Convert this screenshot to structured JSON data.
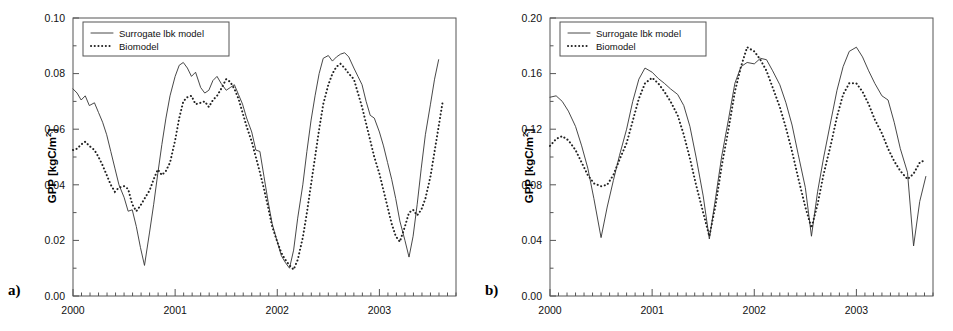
{
  "figure": {
    "panels": [
      {
        "tag": "a)",
        "ylabel_main": "GPP [kgC/m",
        "ylabel_sup": "2",
        "ylabel_close": "]"
      },
      {
        "tag": "b)",
        "ylabel_main": "GPP [kgC/m",
        "ylabel_sup": "2",
        "ylabel_close": "]"
      }
    ],
    "legend": {
      "series1_label": "Surrogate lbk model",
      "series2_label": "Biomodel"
    }
  },
  "chart_data": [
    {
      "panel": "a)",
      "type": "line",
      "title": "",
      "xlabel": "",
      "ylabel": "GPP [kgC/m2]",
      "ylim": [
        0.0,
        0.1
      ],
      "yticks": [
        "0.00",
        "0.02",
        "0.04",
        "0.06",
        "0.08",
        "0.10"
      ],
      "ytick_values": [
        0.0,
        0.02,
        0.04,
        0.06,
        0.08,
        0.1
      ],
      "xlim": [
        2000.0,
        2003.75
      ],
      "xticks": [
        "2000",
        "2001",
        "2002",
        "2003"
      ],
      "xtick_values": [
        2000,
        2001,
        2002,
        2003
      ],
      "minor_ticks_per_interval": 12,
      "grid": false,
      "legend_position": "top-left",
      "series": [
        {
          "name": "Surrogate lbk model",
          "style": "solid",
          "x": [
            2000.0,
            2000.04,
            2000.08,
            2000.12,
            2000.16,
            2000.21,
            2000.25,
            2000.29,
            2000.33,
            2000.37,
            2000.41,
            2000.45,
            2000.5,
            2000.54,
            2000.58,
            2000.62,
            2000.66,
            2000.7,
            2000.75,
            2000.79,
            2000.83,
            2000.87,
            2000.91,
            2000.95,
            2001.0,
            2001.04,
            2001.08,
            2001.12,
            2001.16,
            2001.2,
            2001.25,
            2001.29,
            2001.33,
            2001.37,
            2001.41,
            2001.45,
            2001.5,
            2001.54,
            2001.58,
            2001.62,
            2001.66,
            2001.7,
            2001.75,
            2001.79,
            2001.83,
            2001.87,
            2001.91,
            2001.95,
            2002.0,
            2002.04,
            2002.08,
            2002.12,
            2002.16,
            2002.2,
            2002.25,
            2002.29,
            2002.33,
            2002.37,
            2002.41,
            2002.45,
            2002.5,
            2002.54,
            2002.58,
            2002.62,
            2002.66,
            2002.7,
            2002.75,
            2002.79,
            2002.83,
            2002.87,
            2002.91,
            2002.95,
            2003.0,
            2003.04,
            2003.08,
            2003.12,
            2003.16,
            2003.2,
            2003.25,
            2003.29,
            2003.33,
            2003.37,
            2003.41,
            2003.45,
            2003.5,
            2003.54,
            2003.58,
            2003.62,
            2003.66
          ],
          "y": [
            0.0745,
            0.073,
            0.0705,
            0.072,
            0.0685,
            0.0695,
            0.066,
            0.0625,
            0.058,
            0.052,
            0.046,
            0.04,
            0.0355,
            0.0305,
            0.031,
            0.025,
            0.0175,
            0.011,
            0.023,
            0.033,
            0.044,
            0.0545,
            0.064,
            0.072,
            0.079,
            0.083,
            0.084,
            0.082,
            0.079,
            0.0805,
            0.075,
            0.073,
            0.074,
            0.0775,
            0.079,
            0.0765,
            0.074,
            0.075,
            0.076,
            0.0725,
            0.069,
            0.064,
            0.059,
            0.0525,
            0.052,
            0.043,
            0.034,
            0.026,
            0.0195,
            0.0145,
            0.012,
            0.01,
            0.0165,
            0.028,
            0.04,
            0.052,
            0.063,
            0.072,
            0.08,
            0.0855,
            0.0865,
            0.0845,
            0.086,
            0.087,
            0.0875,
            0.086,
            0.082,
            0.079,
            0.076,
            0.07,
            0.065,
            0.064,
            0.059,
            0.054,
            0.048,
            0.042,
            0.035,
            0.027,
            0.02,
            0.014,
            0.0215,
            0.033,
            0.046,
            0.058,
            0.069,
            0.078,
            0.085
          ]
        },
        {
          "name": "Biomodel",
          "style": "dotted",
          "x": [
            2000.0,
            2000.04,
            2000.08,
            2000.12,
            2000.16,
            2000.21,
            2000.25,
            2000.29,
            2000.33,
            2000.37,
            2000.41,
            2000.45,
            2000.5,
            2000.54,
            2000.58,
            2000.62,
            2000.66,
            2000.7,
            2000.75,
            2000.79,
            2000.83,
            2000.87,
            2000.91,
            2000.95,
            2001.0,
            2001.04,
            2001.08,
            2001.12,
            2001.16,
            2001.2,
            2001.25,
            2001.29,
            2001.33,
            2001.37,
            2001.41,
            2001.45,
            2001.5,
            2001.54,
            2001.58,
            2001.62,
            2001.66,
            2001.7,
            2001.75,
            2001.79,
            2001.83,
            2001.87,
            2001.91,
            2001.95,
            2002.0,
            2002.04,
            2002.08,
            2002.12,
            2002.16,
            2002.2,
            2002.25,
            2002.29,
            2002.33,
            2002.37,
            2002.41,
            2002.45,
            2002.5,
            2002.54,
            2002.58,
            2002.62,
            2002.66,
            2002.7,
            2002.75,
            2002.79,
            2002.83,
            2002.87,
            2002.91,
            2002.95,
            2003.0,
            2003.04,
            2003.08,
            2003.12,
            2003.16,
            2003.2,
            2003.25,
            2003.29,
            2003.33,
            2003.37,
            2003.41,
            2003.45,
            2003.5,
            2003.54,
            2003.58,
            2003.62,
            2003.66
          ],
          "y": [
            0.0525,
            0.053,
            0.0545,
            0.0555,
            0.054,
            0.0525,
            0.05,
            0.047,
            0.0435,
            0.04,
            0.0375,
            0.039,
            0.0395,
            0.0385,
            0.033,
            0.0305,
            0.0325,
            0.035,
            0.038,
            0.042,
            0.0455,
            0.0435,
            0.045,
            0.048,
            0.056,
            0.064,
            0.07,
            0.0715,
            0.072,
            0.069,
            0.0695,
            0.07,
            0.068,
            0.0705,
            0.072,
            0.0745,
            0.078,
            0.077,
            0.0745,
            0.071,
            0.066,
            0.061,
            0.0555,
            0.05,
            0.0445,
            0.0385,
            0.032,
            0.025,
            0.0195,
            0.0155,
            0.013,
            0.011,
            0.0095,
            0.013,
            0.021,
            0.03,
            0.04,
            0.05,
            0.06,
            0.069,
            0.076,
            0.08,
            0.0825,
            0.0835,
            0.082,
            0.08,
            0.078,
            0.073,
            0.068,
            0.062,
            0.056,
            0.05,
            0.044,
            0.038,
            0.032,
            0.026,
            0.0215,
            0.0195,
            0.025,
            0.03,
            0.031,
            0.029,
            0.031,
            0.035,
            0.043,
            0.052,
            0.061,
            0.07
          ]
        }
      ]
    },
    {
      "panel": "b)",
      "type": "line",
      "title": "",
      "xlabel": "",
      "ylabel": "GPP [kgC/m2]",
      "ylim": [
        0.0,
        0.2
      ],
      "yticks": [
        "0.00",
        "0.04",
        "0.08",
        "0.12",
        "0.16",
        "0.20"
      ],
      "ytick_values": [
        0.0,
        0.04,
        0.08,
        0.12,
        0.16,
        0.2
      ],
      "xlim": [
        2000.0,
        2003.75
      ],
      "xticks": [
        "2000",
        "2001",
        "2002",
        "2003"
      ],
      "xtick_values": [
        2000,
        2001,
        2002,
        2003
      ],
      "minor_ticks_per_interval": 12,
      "grid": false,
      "legend_position": "top-left",
      "series": [
        {
          "name": "Surrogate lbk model",
          "style": "solid",
          "x": [
            2000.0,
            2000.06,
            2000.12,
            2000.18,
            2000.25,
            2000.31,
            2000.37,
            2000.43,
            2000.5,
            2000.56,
            2000.62,
            2000.68,
            2000.75,
            2000.81,
            2000.87,
            2000.93,
            2001.0,
            2001.06,
            2001.12,
            2001.18,
            2001.25,
            2001.31,
            2001.37,
            2001.43,
            2001.5,
            2001.56,
            2001.62,
            2001.68,
            2001.75,
            2001.81,
            2001.87,
            2001.93,
            2002.0,
            2002.06,
            2002.12,
            2002.18,
            2002.25,
            2002.31,
            2002.37,
            2002.43,
            2002.5,
            2002.56,
            2002.62,
            2002.68,
            2002.75,
            2002.81,
            2002.87,
            2002.93,
            2003.0,
            2003.06,
            2003.12,
            2003.18,
            2003.25,
            2003.31,
            2003.37,
            2003.43,
            2003.5,
            2003.56,
            2003.62,
            2003.68
          ],
          "y": [
            0.143,
            0.144,
            0.14,
            0.133,
            0.122,
            0.108,
            0.092,
            0.07,
            0.042,
            0.064,
            0.083,
            0.101,
            0.12,
            0.14,
            0.156,
            0.164,
            0.161,
            0.1565,
            0.153,
            0.149,
            0.145,
            0.137,
            0.122,
            0.1,
            0.072,
            0.041,
            0.07,
            0.1,
            0.128,
            0.153,
            0.165,
            0.168,
            0.167,
            0.171,
            0.17,
            0.162,
            0.152,
            0.139,
            0.123,
            0.102,
            0.078,
            0.043,
            0.075,
            0.1,
            0.126,
            0.148,
            0.165,
            0.176,
            0.179,
            0.172,
            0.162,
            0.153,
            0.144,
            0.141,
            0.125,
            0.106,
            0.089,
            0.036,
            0.068,
            0.086
          ]
        },
        {
          "name": "Biomodel",
          "style": "dotted",
          "x": [
            2000.0,
            2000.06,
            2000.12,
            2000.18,
            2000.25,
            2000.31,
            2000.37,
            2000.43,
            2000.5,
            2000.56,
            2000.62,
            2000.68,
            2000.75,
            2000.81,
            2000.87,
            2000.93,
            2001.0,
            2001.06,
            2001.12,
            2001.18,
            2001.25,
            2001.31,
            2001.37,
            2001.43,
            2001.5,
            2001.56,
            2001.62,
            2001.68,
            2001.75,
            2001.81,
            2001.87,
            2001.93,
            2002.0,
            2002.06,
            2002.12,
            2002.18,
            2002.25,
            2002.31,
            2002.37,
            2002.43,
            2002.5,
            2002.56,
            2002.62,
            2002.68,
            2002.75,
            2002.81,
            2002.87,
            2002.93,
            2003.0,
            2003.06,
            2003.12,
            2003.18,
            2003.25,
            2003.31,
            2003.37,
            2003.43,
            2003.5,
            2003.56,
            2003.62,
            2003.68
          ],
          "y": [
            0.108,
            0.113,
            0.115,
            0.112,
            0.105,
            0.096,
            0.087,
            0.081,
            0.079,
            0.08,
            0.087,
            0.098,
            0.11,
            0.126,
            0.142,
            0.153,
            0.157,
            0.153,
            0.147,
            0.14,
            0.13,
            0.116,
            0.099,
            0.08,
            0.06,
            0.043,
            0.065,
            0.093,
            0.121,
            0.147,
            0.165,
            0.179,
            0.176,
            0.17,
            0.162,
            0.15,
            0.136,
            0.121,
            0.104,
            0.085,
            0.064,
            0.049,
            0.066,
            0.088,
            0.109,
            0.129,
            0.145,
            0.153,
            0.153,
            0.147,
            0.138,
            0.127,
            0.117,
            0.106,
            0.097,
            0.09,
            0.084,
            0.088,
            0.096,
            0.098
          ]
        }
      ]
    }
  ]
}
